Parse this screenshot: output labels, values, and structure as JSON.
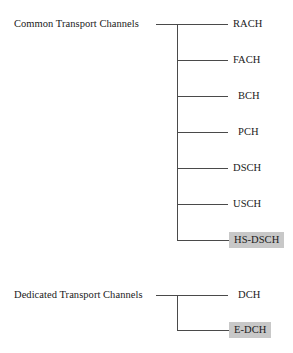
{
  "diagram": {
    "type": "tree",
    "title": "",
    "width": 293,
    "height": 353,
    "background_color": "#ffffff",
    "line_color": "#4a4a4a",
    "text_color": "#1a1a1a",
    "highlight_color": "#c8c8c8",
    "groups": [
      {
        "id": "common-transport-channels",
        "label": "Common Transport Channels",
        "children": [
          {
            "label": "RACH",
            "highlighted": false
          },
          {
            "label": "FACH",
            "highlighted": false
          },
          {
            "label": "BCH",
            "highlighted": false
          },
          {
            "label": "PCH",
            "highlighted": false
          },
          {
            "label": "DSCH",
            "highlighted": false
          },
          {
            "label": "USCH",
            "highlighted": false
          },
          {
            "label": "HS-DSCH",
            "highlighted": true
          }
        ]
      },
      {
        "id": "dedicated-transport-channels",
        "label": "Dedicated Transport Channels",
        "children": [
          {
            "label": "DCH",
            "highlighted": false
          },
          {
            "label": "E-DCH",
            "highlighted": true
          }
        ]
      }
    ]
  }
}
